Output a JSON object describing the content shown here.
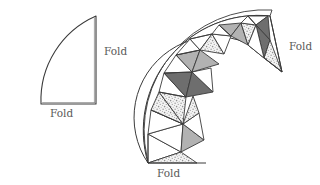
{
  "figure": {
    "background_color": "#ffffff",
    "stroke_color": "#3a3a3a",
    "label_color": "#5a5a5a"
  },
  "palette": {
    "white": "#ffffff",
    "light_gray": "#b2b2b2",
    "dark_gray": "#6e6e6e",
    "stipple_base": "#f2f2f2",
    "stipple_dot": "#9a9a9a",
    "outline": "#3a3a3a"
  },
  "left_shape": {
    "name": "quarter-circle",
    "description": "Quarter circle with arc on upper left, straight vertical edge on right and straight horizontal edge at bottom",
    "fill": "#ffffff",
    "labels": [
      {
        "id": "right-fold",
        "text": "Fold",
        "position": "right-edge"
      },
      {
        "id": "bottom-fold",
        "text": "Fold",
        "position": "bottom-edge"
      }
    ]
  },
  "right_shape": {
    "name": "curved-triangulated-band",
    "description": "Quarter annular band subdivided into alternating triangles with white, light gray, stippled and dark gray fills",
    "labels": [
      {
        "id": "upper-fold",
        "text": "Fold",
        "position": "upper-right-radial-end"
      },
      {
        "id": "lower-fold",
        "text": "Fold",
        "position": "lower-left-radial-end"
      }
    ],
    "segment_count": 8,
    "triangle_fills": [
      "white",
      "stipple",
      "light_gray",
      "white",
      "stipple",
      "dark_gray",
      "white",
      "stipple",
      "light_gray",
      "white",
      "dark_gray",
      "stipple",
      "white",
      "light_gray",
      "stipple",
      "dark_gray"
    ]
  }
}
